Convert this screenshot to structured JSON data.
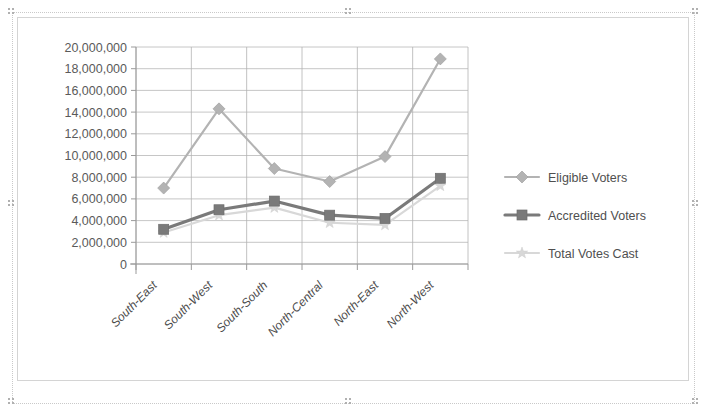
{
  "chart_object": {
    "name": "voter-statistics-line-chart",
    "selected": true
  },
  "chart_data": {
    "type": "line",
    "title": "",
    "xlabel": "",
    "ylabel": "",
    "grid": true,
    "legend_position": "right",
    "ylim": [
      0,
      20000000
    ],
    "ytick_step": 2000000,
    "categories": [
      "South-East",
      "South-West",
      "South-South",
      "North-Central",
      "North-East",
      "North-West"
    ],
    "ytick_labels": [
      "20,000,000",
      "18,000,000",
      "16,000,000",
      "14,000,000",
      "12,000,000",
      "10,000,000",
      "8,000,000",
      "6,000,000",
      "4,000,000",
      "2,000,000",
      "0"
    ],
    "series": [
      {
        "name": "Eligible Voters",
        "marker": "diamond",
        "color": "#b3b3b3",
        "values": [
          7000000,
          14300000,
          8800000,
          7600000,
          9900000,
          18900000
        ]
      },
      {
        "name": "Accredited Voters",
        "marker": "square",
        "color": "#7a7a7a",
        "values": [
          3200000,
          5000000,
          5800000,
          4500000,
          4200000,
          7900000
        ]
      },
      {
        "name": "Total Votes Cast",
        "marker": "star",
        "color": "#d8d8d8",
        "values": [
          2900000,
          4500000,
          5200000,
          3800000,
          3600000,
          7200000
        ]
      }
    ]
  },
  "legend": {
    "items": [
      {
        "label": "Eligible Voters",
        "marker": "diamond",
        "color": "#b3b3b3"
      },
      {
        "label": "Accredited Voters",
        "marker": "square",
        "color": "#7a7a7a"
      },
      {
        "label": "Total Votes Cast",
        "marker": "star",
        "color": "#d8d8d8"
      }
    ]
  },
  "colors": {
    "plot_background": "#ffffff",
    "gridline": "#b8b8b8",
    "axis": "#9a9a9a",
    "frame_border": "#d4d4d4",
    "selection_border": "#c9c9c9",
    "tick_text": "#5a5a5a",
    "category_text": "#4a4a4a"
  }
}
